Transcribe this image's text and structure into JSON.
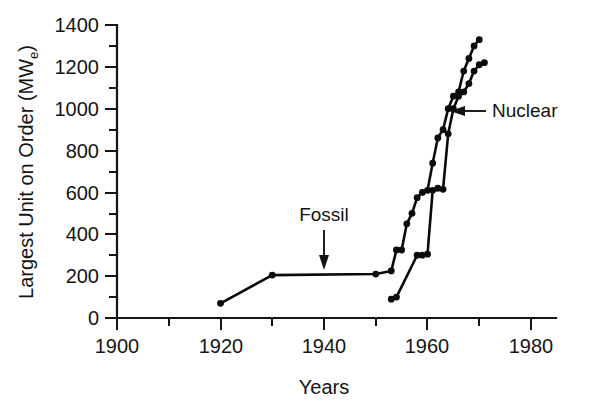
{
  "chart_data": {
    "type": "line",
    "title": "",
    "xlabel": "Years",
    "ylabel": "Largest Unit on Order (MW",
    "ylabel_sub": "e",
    "ylabel_suffix": ")",
    "xlim": [
      1900,
      1985
    ],
    "ylim": [
      0,
      1400
    ],
    "xticks": [
      1900,
      1920,
      1940,
      1960,
      1980
    ],
    "xtick_labels": [
      "1900",
      "1920",
      "1940",
      "1960",
      "1980"
    ],
    "xminor_ticks": [
      1910,
      1930,
      1950,
      1970
    ],
    "yticks": [
      0,
      200,
      400,
      600,
      800,
      1000,
      1200,
      1400
    ],
    "ytick_labels": [
      "0",
      "200",
      "400",
      "600",
      "800",
      "1000",
      "1200",
      "1400"
    ],
    "yminor_ticks": [
      100,
      300,
      500,
      700,
      900,
      1100,
      1300
    ],
    "grid": false,
    "legend": "none",
    "marker": "filled-circle",
    "line_color": "#0a0a0a",
    "series": [
      {
        "name": "Fossil",
        "x": [
          1920,
          1930,
          1950,
          1953,
          1954,
          1955,
          1956,
          1957,
          1958,
          1959,
          1960,
          1961,
          1962,
          1963,
          1964,
          1965,
          1966,
          1967,
          1968,
          1969,
          1970
        ],
        "values": [
          70,
          205,
          210,
          225,
          325,
          325,
          450,
          500,
          575,
          600,
          610,
          740,
          860,
          900,
          1000,
          1060,
          1080,
          1180,
          1240,
          1300,
          1330
        ]
      },
      {
        "name": "Nuclear",
        "x": [
          1953,
          1954,
          1958,
          1959,
          1960,
          1961,
          1962,
          1963,
          1964,
          1965,
          1966,
          1967,
          1968,
          1969,
          1970,
          1971
        ],
        "values": [
          90,
          100,
          300,
          300,
          305,
          610,
          620,
          615,
          880,
          1000,
          1060,
          1080,
          1120,
          1180,
          1210,
          1220
        ]
      }
    ],
    "annotations": [
      {
        "label": "Fossil",
        "target_x": 1940,
        "target_y": 215,
        "text_x": 1940,
        "text_y": 440
      },
      {
        "label": "Nuclear",
        "target_x": 1965,
        "target_y": 1000,
        "text_x": 1974,
        "text_y": 1000
      }
    ]
  }
}
